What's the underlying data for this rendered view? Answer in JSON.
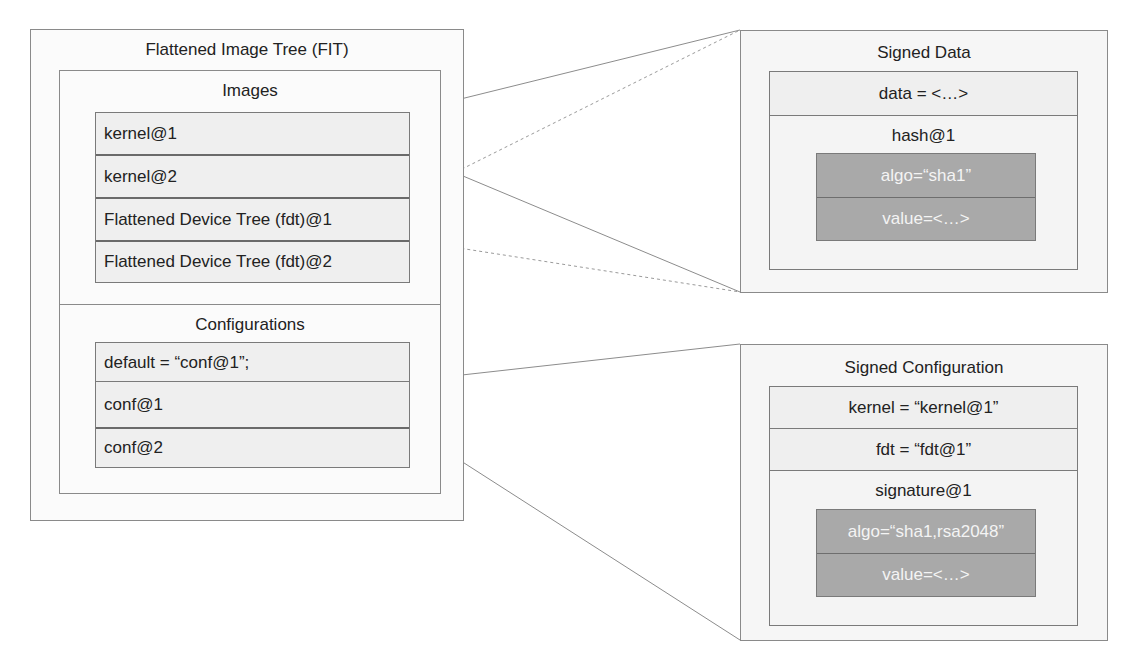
{
  "fit": {
    "title": "Flattened Image Tree (FIT)",
    "images": {
      "title": "Images",
      "items": [
        {
          "label": "kernel@1"
        },
        {
          "label": "kernel@2"
        },
        {
          "label": "Flattened Device Tree (fdt)@1"
        },
        {
          "label": "Flattened Device Tree (fdt)@2"
        }
      ]
    },
    "configurations": {
      "title": "Configurations",
      "items": [
        {
          "label": "default = “conf@1”;"
        },
        {
          "label": "conf@1"
        },
        {
          "label": "conf@2"
        }
      ]
    }
  },
  "signed_data": {
    "title": "Signed Data",
    "data_row": "data = <…>",
    "hash": {
      "title": "hash@1",
      "algo": "algo=“sha1”",
      "value": "value=<…>"
    }
  },
  "signed_configuration": {
    "title": "Signed Configuration",
    "kernel_row": "kernel = “kernel@1”",
    "fdt_row": "fdt = “fdt@1”",
    "signature": {
      "title": "signature@1",
      "algo": "algo=“sha1,rsa2048”",
      "value": "value=<…>"
    }
  },
  "connectors": [
    {
      "from": "kernel@1",
      "to": "signed-data",
      "style": "solid"
    },
    {
      "from": "kernel@2",
      "to": "signed-data",
      "style": "solid"
    },
    {
      "from": "fdt@1",
      "to": "signed-data",
      "style": "dashed"
    },
    {
      "from": "fdt@2",
      "to": "signed-data",
      "style": "dashed"
    },
    {
      "from": "conf@1",
      "to": "signed-configuration",
      "style": "solid"
    }
  ],
  "colors": {
    "border": "#8a8a8a",
    "row_bg": "#efefef",
    "panel_bg": "#f6f6f6",
    "gray_box": "#a9a9a9",
    "gray_text": "#f4f4f4",
    "line": "#8c8c8c"
  }
}
